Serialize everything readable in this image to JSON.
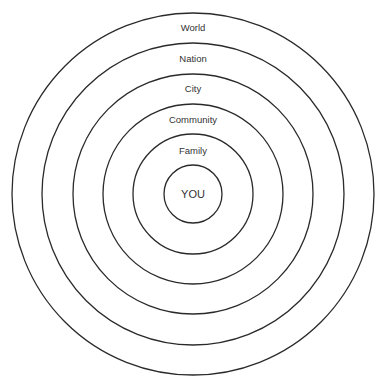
{
  "diagram": {
    "type": "concentric-circles",
    "center": {
      "x": 193,
      "y": 194
    },
    "stroke_color": "#2a2a2a",
    "rings": [
      {
        "label": "World",
        "radius": 181,
        "label_y": 22
      },
      {
        "label": "Nation",
        "radius": 151,
        "label_y": 53
      },
      {
        "label": "City",
        "radius": 120,
        "label_y": 83
      },
      {
        "label": "Community",
        "radius": 90,
        "label_y": 114
      },
      {
        "label": "Family",
        "radius": 60,
        "label_y": 145
      },
      {
        "label": "YOU",
        "radius": 29,
        "label_y": 188
      }
    ]
  }
}
